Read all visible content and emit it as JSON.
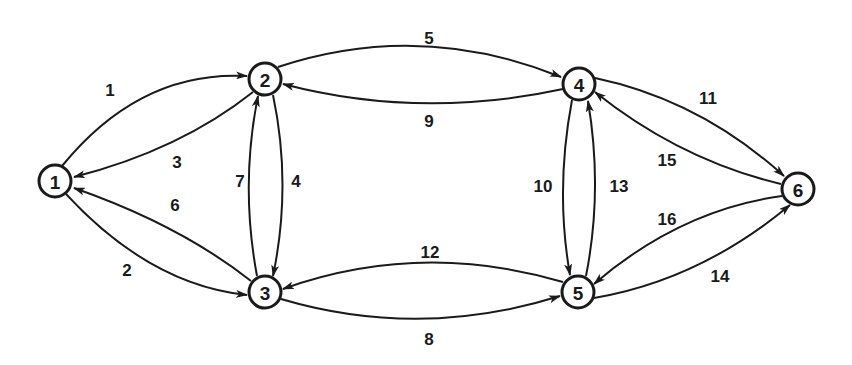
{
  "diagram": {
    "type": "directed-graph",
    "node_radius": 16,
    "colors": {
      "stroke": "#1a1a1a",
      "background": "#ffffff"
    },
    "nodes": [
      {
        "id": "1",
        "label": "1",
        "x": 55,
        "y": 181
      },
      {
        "id": "2",
        "label": "2",
        "x": 265,
        "y": 79
      },
      {
        "id": "3",
        "label": "3",
        "x": 265,
        "y": 292
      },
      {
        "id": "4",
        "label": "4",
        "x": 579,
        "y": 84
      },
      {
        "id": "5",
        "label": "5",
        "x": 578,
        "y": 292
      },
      {
        "id": "6",
        "label": "6",
        "x": 798,
        "y": 189
      }
    ],
    "edges": [
      {
        "label": "1",
        "from": "1",
        "to": "2",
        "path": "M 62 166 Q 140 70 247 76",
        "lx": 110,
        "ly": 90
      },
      {
        "label": "2",
        "from": "1",
        "to": "3",
        "path": "M 66 194 Q 150 285 247 295",
        "lx": 127,
        "ly": 270
      },
      {
        "label": "3",
        "from": "2",
        "to": "1",
        "path": "M 253 92 Q 180 150 74 177",
        "lx": 177,
        "ly": 162
      },
      {
        "label": "6",
        "from": "3",
        "to": "1",
        "path": "M 251 281 Q 180 225 74 188",
        "lx": 175,
        "ly": 205
      },
      {
        "label": "4",
        "from": "2",
        "to": "3",
        "path": "M 273 95 Q 292 185 273 276",
        "lx": 296,
        "ly": 181
      },
      {
        "label": "7",
        "from": "3",
        "to": "2",
        "path": "M 257 276 Q 240 185 258 96",
        "lx": 240,
        "ly": 181
      },
      {
        "label": "5",
        "from": "2",
        "to": "4",
        "path": "M 278 67 Q 420 20 561 77",
        "lx": 429,
        "ly": 38
      },
      {
        "label": "9",
        "from": "4",
        "to": "2",
        "path": "M 563 89 Q 420 120 283 84",
        "lx": 429,
        "ly": 121
      },
      {
        "label": "8",
        "from": "3",
        "to": "5",
        "path": "M 281 299 Q 420 340 560 296",
        "lx": 429,
        "ly": 339
      },
      {
        "label": "12",
        "from": "5",
        "to": "3",
        "path": "M 563 282 Q 420 240 283 289",
        "lx": 430,
        "ly": 252
      },
      {
        "label": "10",
        "from": "4",
        "to": "5",
        "path": "M 572 100 Q 555 190 570 275",
        "lx": 543,
        "ly": 186
      },
      {
        "label": "13",
        "from": "5",
        "to": "4",
        "path": "M 586 276 Q 603 190 588 101",
        "lx": 619,
        "ly": 186
      },
      {
        "label": "11",
        "from": "4",
        "to": "6",
        "path": "M 595 78 Q 700 100 784 176",
        "lx": 708,
        "ly": 98
      },
      {
        "label": "15",
        "from": "6",
        "to": "4",
        "path": "M 781 184 Q 680 160 595 92",
        "lx": 667,
        "ly": 160
      },
      {
        "label": "16",
        "from": "6",
        "to": "5",
        "path": "M 782 196 Q 680 210 594 284",
        "lx": 667,
        "ly": 219
      },
      {
        "label": "14",
        "from": "5",
        "to": "6",
        "path": "M 594 298 Q 700 280 790 205",
        "lx": 720,
        "ly": 276
      }
    ]
  }
}
